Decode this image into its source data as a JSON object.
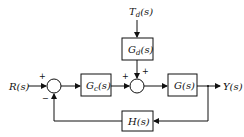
{
  "diagram": {
    "type": "block-diagram",
    "inputs": {
      "reference": {
        "main": "R",
        "arg": "(s)"
      },
      "disturbance": {
        "main": "T",
        "sub": "d",
        "arg": "(s)"
      }
    },
    "output": {
      "main": "Y",
      "arg": "(s)"
    },
    "blocks": {
      "controller": {
        "main": "G",
        "sub": "c",
        "arg": "(s)"
      },
      "disturbance_tf": {
        "main": "G",
        "sub": "d",
        "arg": "(s)"
      },
      "plant": {
        "main": "G",
        "arg": "(s)"
      },
      "feedback": {
        "main": "H",
        "arg": "(s)"
      }
    },
    "summing_junctions": {
      "sum1": {
        "top_left_sign": "+",
        "bottom_sign": "−"
      },
      "sum2": {
        "left_sign": "+",
        "top_sign": "+"
      }
    }
  }
}
